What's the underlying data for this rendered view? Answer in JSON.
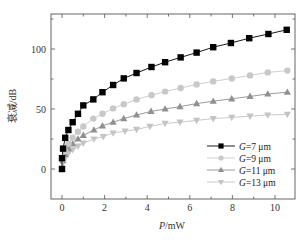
{
  "chart_data": {
    "type": "line",
    "title": "",
    "xlabel": "P/mW",
    "xlabel_italic": "P",
    "xlabel_unit": "/mW",
    "ylabel": "衰减/dB",
    "xlim": [
      -0.6,
      10.9
    ],
    "ylim": [
      -21,
      129
    ],
    "xticks": [
      0,
      2,
      4,
      6,
      8,
      10
    ],
    "yticks": [
      0,
      50,
      100
    ],
    "grid": false,
    "legend_position": "lower right",
    "series": [
      {
        "name": "G=7 μm",
        "label_italic": "G",
        "label_rest": "=7 μm",
        "marker": "square",
        "color": "#000000",
        "line_color": "#000000",
        "x": [
          0,
          0.0,
          0.05,
          0.15,
          0.3,
          0.5,
          0.75,
          1.0,
          1.47,
          1.9,
          2.4,
          2.9,
          3.5,
          4.2,
          4.84,
          5.57,
          6.32,
          7.1,
          7.93,
          8.79,
          9.69,
          10.55
        ],
        "y": [
          0,
          9,
          17,
          26,
          32.5,
          39,
          46,
          53,
          58,
          64,
          70,
          75.5,
          80,
          85,
          89,
          93,
          97,
          101.5,
          105,
          109,
          112.5,
          116
        ]
      },
      {
        "name": "G=9 μm",
        "label_italic": "G",
        "label_rest": "=9 μm",
        "marker": "circle",
        "color": "#c8c8c8",
        "line_color": "#c8c8c8",
        "x": [
          0,
          0.05,
          0.15,
          0.3,
          0.5,
          0.75,
          1.0,
          1.47,
          1.9,
          2.4,
          2.9,
          3.5,
          4.2,
          4.84,
          5.57,
          6.32,
          7.1,
          7.97,
          8.83,
          9.66,
          10.58
        ],
        "y": [
          0,
          8,
          15,
          21,
          26,
          31,
          35.5,
          42,
          46,
          50.5,
          54,
          58,
          61.5,
          64.5,
          67.5,
          70.5,
          73,
          75.5,
          78,
          80.5,
          82
        ]
      },
      {
        "name": "G=11 μm",
        "label_italic": "G",
        "label_rest": "=11 μm",
        "marker": "triangle-up",
        "color": "#909090",
        "line_color": "#909090",
        "x": [
          0,
          0.05,
          0.15,
          0.3,
          0.5,
          0.75,
          1.0,
          1.5,
          1.9,
          2.4,
          2.9,
          3.5,
          4.18,
          4.84,
          5.54,
          6.32,
          7.1,
          7.97,
          8.83,
          9.66,
          10.58
        ],
        "y": [
          0,
          7,
          12,
          17,
          21,
          25,
          28,
          32.5,
          36,
          39,
          42,
          45,
          48,
          50,
          52,
          54.5,
          56.5,
          58.5,
          60.5,
          62.5,
          64
        ]
      },
      {
        "name": "G=13 μm",
        "label_italic": "G",
        "label_rest": "=13 μm",
        "marker": "triangle-down",
        "color": "#c4c4c4",
        "line_color": "#c4c4c4",
        "x": [
          0,
          0.05,
          0.15,
          0.3,
          0.5,
          0.75,
          1.0,
          1.5,
          1.94,
          2.4,
          2.96,
          3.5,
          4.13,
          4.84,
          5.54,
          6.32,
          7.1,
          7.97,
          8.83,
          9.66,
          10.58
        ],
        "y": [
          0,
          5,
          9,
          13,
          16,
          19,
          21.5,
          25,
          27,
          30,
          31.5,
          33,
          35.5,
          38,
          39,
          40.5,
          42,
          43,
          44,
          45,
          45.5
        ]
      }
    ]
  },
  "axes": {
    "x_label_italic": "P",
    "x_label_unit": "/mW",
    "y_label": "衰减/dB"
  }
}
